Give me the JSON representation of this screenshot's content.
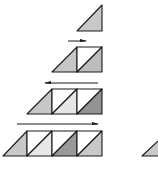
{
  "diagram": {
    "colors": {
      "stroke": "#1a1a1a",
      "background": "#ffffff",
      "white": "#ffffff",
      "very_light": "#e6e6e6",
      "light": "#c8c8c8",
      "medium": "#bcbcbc",
      "dark": "#939393"
    },
    "rows": [
      {
        "id": "row-1",
        "lead_triangle": {
          "x0": 77,
          "y0": 5,
          "x1": 102,
          "y1": 31,
          "fill": "#c8c8c8"
        },
        "squares": [],
        "arrow": null
      },
      {
        "id": "row-2",
        "lead_triangle": {
          "x0": 52,
          "y0": 47,
          "x1": 77,
          "y1": 72,
          "fill": "#c6c6c6"
        },
        "squares": [
          {
            "x0": 77,
            "x1": 102,
            "upper_fill": "#ffffff",
            "lower_fill": "#bcbcbc"
          }
        ],
        "arrow": {
          "direction": "right",
          "x_start": 68,
          "x_end": 86,
          "y": 41
        }
      },
      {
        "id": "row-3",
        "lead_triangle": {
          "x0": 27,
          "y0": 89,
          "x1": 52,
          "y1": 114,
          "fill": "#c8c8c8"
        },
        "squares": [
          {
            "x0": 52,
            "x1": 77,
            "upper_fill": "#ffffff",
            "lower_fill": "#e6e6e6"
          },
          {
            "x0": 77,
            "x1": 102,
            "upper_fill": "#ffffff",
            "lower_fill": "#939393"
          }
        ],
        "arrow": {
          "direction": "left",
          "x_start": 45,
          "x_end": 98,
          "y": 83
        }
      },
      {
        "id": "row-4",
        "lead_triangle": {
          "x0": 3,
          "y0": 131,
          "x1": 27,
          "y1": 156,
          "fill": "#c8c8c8"
        },
        "squares": [
          {
            "x0": 27,
            "x1": 52,
            "upper_fill": "#ffffff",
            "lower_fill": "#e8e8e8"
          },
          {
            "x0": 52,
            "x1": 77,
            "upper_fill": "#ffffff",
            "lower_fill": "#999999"
          },
          {
            "x0": 77,
            "x1": 102,
            "upper_fill": "#ffffff",
            "lower_fill": "#c8c8c8"
          }
        ],
        "arrow": {
          "direction": "right",
          "x_start": 17,
          "x_end": 98,
          "y": 124
        }
      }
    ],
    "partial_triangle": {
      "x0": 142,
      "y0": 147,
      "x1": 160,
      "y1": 156,
      "fill": "#c8c8c8"
    }
  }
}
